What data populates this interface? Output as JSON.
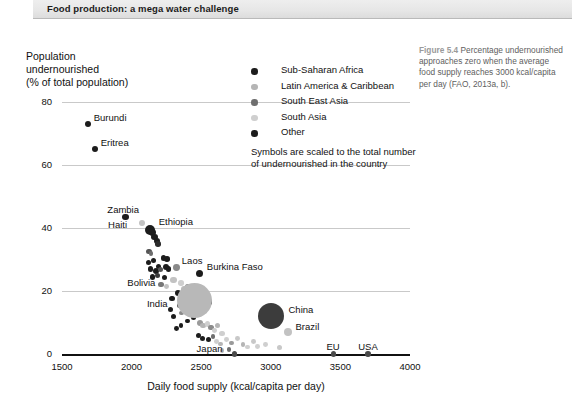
{
  "banner": {
    "title": "Food production: a mega water challenge"
  },
  "caption": {
    "figure_number": "Figure 5.4",
    "text": " Percentage undernourished approaches zero when the average food supply reaches 3000 kcal/capita per day (FAO, 2013a, b)."
  },
  "legend": {
    "items": [
      {
        "label": "Sub-Saharan Africa",
        "color": "#1c1c1c"
      },
      {
        "label": "Latin America & Caribbean",
        "color": "#b5b5b5"
      },
      {
        "label": "South East Asia",
        "color": "#6e6e6e"
      },
      {
        "label": "South Asia",
        "color": "#cfcfcf"
      },
      {
        "label": "Other",
        "color": "#1c1c1c"
      }
    ],
    "note": "Symbols are scaled to the total number of undernourished in the country"
  },
  "chart_data": {
    "type": "scatter",
    "title": "",
    "xlabel": "Daily food supply (kcal/capita per day)",
    "ylabel": "Population\nundernourished\n(% of total population)",
    "xlim": [
      1500,
      4000
    ],
    "ylim": [
      0,
      80
    ],
    "xticks": [
      1500,
      2000,
      2500,
      3000,
      3500,
      4000
    ],
    "yticks": [
      0,
      20,
      40,
      60,
      80
    ],
    "grid": "horizontal",
    "legend_position": "top-right",
    "size_encoding": "Symbols are scaled to the total number of undernourished in the country",
    "series": [
      {
        "name": "Sub-Saharan Africa",
        "color": "#1c1c1c"
      },
      {
        "name": "Latin America & Caribbean",
        "color": "#b5b5b5"
      },
      {
        "name": "South East Asia",
        "color": "#6e6e6e"
      },
      {
        "name": "South Asia",
        "color": "#cfcfcf"
      },
      {
        "name": "Other",
        "color": "#1c1c1c"
      }
    ],
    "labeled_points": [
      {
        "name": "Burundi",
        "x": 1685,
        "y": 73,
        "r": 3.0,
        "color": "#1c1c1c",
        "label_dx": 6,
        "label_dy": -12
      },
      {
        "name": "Eritrea",
        "x": 1735,
        "y": 65,
        "r": 3.0,
        "color": "#1c1c1c",
        "label_dx": 6,
        "label_dy": -12
      },
      {
        "name": "Zambia",
        "x": 1955,
        "y": 43.5,
        "r": 3.2,
        "color": "#1c1c1c",
        "label_dx": -18,
        "label_dy": -13
      },
      {
        "name": "Haiti",
        "x": 2075,
        "y": 41.5,
        "r": 3.2,
        "color": "#c2c2c2",
        "label_dx": -34,
        "label_dy": -4
      },
      {
        "name": "Ethiopia",
        "x": 2130,
        "y": 39.5,
        "r": 5.0,
        "color": "#1c1c1c",
        "label_dx": 9,
        "label_dy": -14
      },
      {
        "name": "Laos",
        "x": 2325,
        "y": 27.5,
        "r": 3.4,
        "color": "#8a8a8a",
        "label_dx": 5,
        "label_dy": -12
      },
      {
        "name": "Bolivia",
        "x": 2300,
        "y": 23.5,
        "r": 3.2,
        "color": "#c2c2c2",
        "label_dx": -46,
        "label_dy": -3
      },
      {
        "name": "Burkina Faso",
        "x": 2490,
        "y": 25.5,
        "r": 3.6,
        "color": "#1c1c1c",
        "label_dx": 7,
        "label_dy": -13
      },
      {
        "name": "India",
        "x": 2455,
        "y": 17,
        "r": 17.5,
        "color": "#b8b8b8",
        "label_dx": -48,
        "label_dy": -2
      },
      {
        "name": "China",
        "x": 3005,
        "y": 12,
        "r": 13.0,
        "color": "#3c3c3c",
        "label_dx": 17,
        "label_dy": -12
      },
      {
        "name": "Brazil",
        "x": 3120,
        "y": 7,
        "r": 4.0,
        "color": "#c2c2c2",
        "label_dx": 8,
        "label_dy": -11
      },
      {
        "name": "Japan",
        "x": 2740,
        "y": 0,
        "r": 2.8,
        "color": "#4a4a4a",
        "label_dx": -38,
        "label_dy": -11
      },
      {
        "name": "EU",
        "x": 3450,
        "y": 0,
        "r": 2.8,
        "color": "#4a4a4a",
        "label_dx": -7,
        "label_dy": -13
      },
      {
        "name": "USA",
        "x": 3700,
        "y": 0,
        "r": 2.8,
        "color": "#4a4a4a",
        "label_dx": -10,
        "label_dy": -13
      }
    ],
    "unlabeled_points": [
      {
        "x": 2150,
        "y": 38.5,
        "r": 3.4,
        "color": "#1c1c1c"
      },
      {
        "x": 2165,
        "y": 37.2,
        "r": 3.2,
        "color": "#1c1c1c"
      },
      {
        "x": 2180,
        "y": 36.0,
        "r": 3.0,
        "color": "#1c1c1c"
      },
      {
        "x": 2190,
        "y": 35.0,
        "r": 2.8,
        "color": "#2b2b2b"
      },
      {
        "x": 2125,
        "y": 32.5,
        "r": 2.6,
        "color": "#555555"
      },
      {
        "x": 2140,
        "y": 32.0,
        "r": 2.4,
        "color": "#6e6e6e"
      },
      {
        "x": 2120,
        "y": 29.0,
        "r": 2.8,
        "color": "#1c1c1c"
      },
      {
        "x": 2160,
        "y": 29.8,
        "r": 2.6,
        "color": "#1c1c1c"
      },
      {
        "x": 2230,
        "y": 30.5,
        "r": 2.8,
        "color": "#1c1c1c"
      },
      {
        "x": 2255,
        "y": 30.2,
        "r": 2.8,
        "color": "#1c1c1c"
      },
      {
        "x": 2135,
        "y": 27.0,
        "r": 2.8,
        "color": "#1c1c1c"
      },
      {
        "x": 2175,
        "y": 26.5,
        "r": 3.0,
        "color": "#1c1c1c"
      },
      {
        "x": 2195,
        "y": 27.8,
        "r": 2.6,
        "color": "#1c1c1c"
      },
      {
        "x": 2210,
        "y": 26.8,
        "r": 2.6,
        "color": "#555555"
      },
      {
        "x": 2245,
        "y": 27.5,
        "r": 3.0,
        "color": "#1c1c1c"
      },
      {
        "x": 2265,
        "y": 27.0,
        "r": 2.8,
        "color": "#1c1c1c"
      },
      {
        "x": 2150,
        "y": 24.5,
        "r": 2.8,
        "color": "#1c1c1c"
      },
      {
        "x": 2185,
        "y": 25.0,
        "r": 2.6,
        "color": "#3a3a3a"
      },
      {
        "x": 2235,
        "y": 24.2,
        "r": 2.6,
        "color": "#1c1c1c"
      },
      {
        "x": 2210,
        "y": 22.0,
        "r": 2.8,
        "color": "#777777"
      },
      {
        "x": 2250,
        "y": 21.5,
        "r": 2.4,
        "color": "#c2c2c2"
      },
      {
        "x": 2355,
        "y": 22.5,
        "r": 2.8,
        "color": "#cfcfcf"
      },
      {
        "x": 2375,
        "y": 20.5,
        "r": 3.2,
        "color": "#bdbdbd"
      },
      {
        "x": 2405,
        "y": 21.5,
        "r": 2.6,
        "color": "#8a8a8a"
      },
      {
        "x": 2330,
        "y": 19.5,
        "r": 3.0,
        "color": "#1c1c1c"
      },
      {
        "x": 2430,
        "y": 19.0,
        "r": 3.0,
        "color": "#1c1c1c"
      },
      {
        "x": 2480,
        "y": 19.5,
        "r": 2.8,
        "color": "#1c1c1c"
      },
      {
        "x": 2510,
        "y": 20.2,
        "r": 2.6,
        "color": "#cfcfcf"
      },
      {
        "x": 2540,
        "y": 18.0,
        "r": 2.8,
        "color": "#1c1c1c"
      },
      {
        "x": 2560,
        "y": 16.5,
        "r": 2.6,
        "color": "#1c1c1c"
      },
      {
        "x": 2445,
        "y": 16.0,
        "r": 2.6,
        "color": "#1c1c1c"
      },
      {
        "x": 2470,
        "y": 15.0,
        "r": 2.8,
        "color": "#8a8a8a"
      },
      {
        "x": 2500,
        "y": 14.5,
        "r": 2.6,
        "color": "#1c1c1c"
      },
      {
        "x": 2525,
        "y": 13.5,
        "r": 2.8,
        "color": "#cfcfcf"
      },
      {
        "x": 2420,
        "y": 13.0,
        "r": 2.6,
        "color": "#1c1c1c"
      },
      {
        "x": 2445,
        "y": 11.5,
        "r": 2.6,
        "color": "#1c1c1c"
      },
      {
        "x": 2400,
        "y": 10.5,
        "r": 2.4,
        "color": "#1c1c1c"
      },
      {
        "x": 2490,
        "y": 10.0,
        "r": 3.0,
        "color": "#9a9a9a"
      },
      {
        "x": 2515,
        "y": 9.0,
        "r": 2.8,
        "color": "#b5b5b5"
      },
      {
        "x": 2545,
        "y": 9.5,
        "r": 2.6,
        "color": "#cfcfcf"
      },
      {
        "x": 2570,
        "y": 8.5,
        "r": 2.6,
        "color": "#8a8a8a"
      },
      {
        "x": 2595,
        "y": 7.5,
        "r": 2.4,
        "color": "#cfcfcf"
      },
      {
        "x": 2620,
        "y": 9.0,
        "r": 2.6,
        "color": "#b5b5b5"
      },
      {
        "x": 2650,
        "y": 6.5,
        "r": 2.8,
        "color": "#cfcfcf"
      },
      {
        "x": 2480,
        "y": 6.0,
        "r": 2.6,
        "color": "#1c1c1c"
      },
      {
        "x": 2510,
        "y": 5.0,
        "r": 2.6,
        "color": "#1c1c1c"
      },
      {
        "x": 2555,
        "y": 4.5,
        "r": 2.6,
        "color": "#1c1c1c"
      },
      {
        "x": 2585,
        "y": 5.5,
        "r": 2.4,
        "color": "#6e6e6e"
      },
      {
        "x": 2610,
        "y": 4.0,
        "r": 2.4,
        "color": "#cfcfcf"
      },
      {
        "x": 2640,
        "y": 3.2,
        "r": 2.4,
        "color": "#b5b5b5"
      },
      {
        "x": 2680,
        "y": 4.5,
        "r": 2.4,
        "color": "#cfcfcf"
      },
      {
        "x": 2715,
        "y": 3.5,
        "r": 2.4,
        "color": "#9a9a9a"
      },
      {
        "x": 2760,
        "y": 5.0,
        "r": 2.4,
        "color": "#c8c8c8"
      },
      {
        "x": 2800,
        "y": 3.0,
        "r": 2.4,
        "color": "#b5b5b5"
      },
      {
        "x": 2835,
        "y": 2.2,
        "r": 2.4,
        "color": "#cfcfcf"
      },
      {
        "x": 2875,
        "y": 4.0,
        "r": 2.4,
        "color": "#c8c8c8"
      },
      {
        "x": 2905,
        "y": 2.5,
        "r": 2.4,
        "color": "#cfcfcf"
      },
      {
        "x": 2700,
        "y": 1.5,
        "r": 2.4,
        "color": "#6e6e6e"
      },
      {
        "x": 2650,
        "y": 1.2,
        "r": 2.4,
        "color": "#b5b5b5"
      },
      {
        "x": 2960,
        "y": 3.0,
        "r": 2.4,
        "color": "#cfcfcf"
      },
      {
        "x": 3060,
        "y": 2.0,
        "r": 2.6,
        "color": "#c8c8c8"
      },
      {
        "x": 2290,
        "y": 17.5,
        "r": 2.6,
        "color": "#1c1c1c"
      },
      {
        "x": 2280,
        "y": 14.0,
        "r": 2.6,
        "color": "#1c1c1c"
      },
      {
        "x": 2300,
        "y": 12.0,
        "r": 2.6,
        "color": "#1c1c1c"
      },
      {
        "x": 2345,
        "y": 15.5,
        "r": 2.6,
        "color": "#555555"
      },
      {
        "x": 2360,
        "y": 13.0,
        "r": 2.4,
        "color": "#8a8a8a"
      },
      {
        "x": 2395,
        "y": 17.0,
        "r": 2.4,
        "color": "#6e6e6e"
      },
      {
        "x": 2355,
        "y": 9.0,
        "r": 2.4,
        "color": "#1c1c1c"
      },
      {
        "x": 2320,
        "y": 8.0,
        "r": 2.4,
        "color": "#1c1c1c"
      }
    ]
  }
}
